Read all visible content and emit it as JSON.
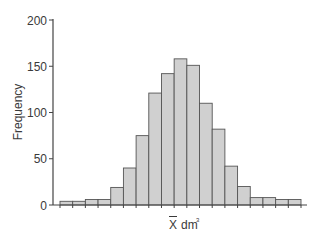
{
  "chart_data": {
    "type": "bar",
    "subtype": "histogram",
    "title": "",
    "xlabel": "X̄ dm³",
    "xlabel_parts": {
      "symbol": "X",
      "overbar": true,
      "unit": "dm",
      "superscript": "3"
    },
    "ylabel": "Frequency",
    "ylim": [
      0,
      200
    ],
    "yticks": [
      0,
      50,
      100,
      150,
      200
    ],
    "xtick_labels_visible": false,
    "grid": false,
    "legend": null,
    "bins": 19,
    "categories": [
      "1",
      "2",
      "3",
      "4",
      "5",
      "6",
      "7",
      "8",
      "9",
      "10",
      "11",
      "12",
      "13",
      "14",
      "15",
      "16",
      "17",
      "18",
      "19"
    ],
    "values": [
      4,
      4,
      6,
      6,
      19,
      40,
      75,
      121,
      142,
      158,
      151,
      110,
      82,
      42,
      20,
      8,
      8,
      6,
      6
    ],
    "colors": {
      "bar_fill": "#d0d0d0",
      "bar_edge": "#555555",
      "axis": "#444444",
      "text": "#3a3a3a"
    }
  }
}
